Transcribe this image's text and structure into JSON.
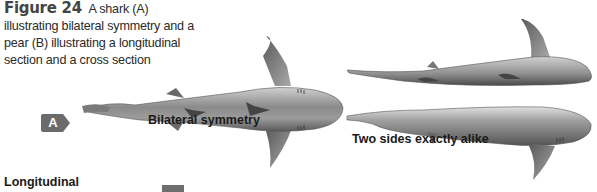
{
  "caption": {
    "figure_label": "Figure 24",
    "text": "A shark (A) illustrating bilateral symmetry and a pear (B) illustrating a longitudinal section and a cross section"
  },
  "badge": {
    "letter": "A",
    "color": "#6b6b6b"
  },
  "labels": {
    "bilateral": "Bilateral symmetry",
    "two_sides": "Two sides exactly alike",
    "longitudinal": "Longitudinal"
  },
  "illustrations": [
    {
      "name": "shark-top-view",
      "description": "Shark seen from above (dorsal view)"
    },
    {
      "name": "shark-half-upper",
      "description": "Upper half of shark, side view"
    },
    {
      "name": "shark-half-lower",
      "description": "Lower half of shark, side view"
    }
  ]
}
